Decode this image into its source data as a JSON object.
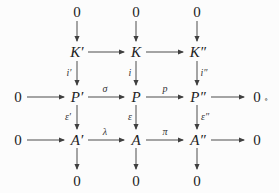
{
  "figure": {
    "type": "commutative-diagram",
    "nodes": {
      "zero_top_left": "0",
      "zero_top_mid": "0",
      "zero_top_right": "0",
      "K_prime": "K′",
      "K": "K",
      "K_dprime": "K″",
      "zero_mid_left": "0",
      "P_prime": "P′",
      "P": "P",
      "P_dprime": "P″",
      "zero_mid_right": "0",
      "zero_low_left": "0",
      "A_prime": "A′",
      "A": "A",
      "A_dprime": "A″",
      "zero_low_right": "0",
      "zero_bottom_left": "0",
      "zero_bottom_mid": "0",
      "zero_bottom_right": "0"
    },
    "terminal_mark": "∘",
    "edges": [
      {
        "from": "zero_top_left",
        "to": "K_prime",
        "label": ""
      },
      {
        "from": "zero_top_mid",
        "to": "K",
        "label": ""
      },
      {
        "from": "zero_top_right",
        "to": "K_dprime",
        "label": ""
      },
      {
        "from": "K_prime",
        "to": "K",
        "label": ""
      },
      {
        "from": "K",
        "to": "K_dprime",
        "label": ""
      },
      {
        "from": "K_prime",
        "to": "P_prime",
        "label": "i′"
      },
      {
        "from": "K",
        "to": "P",
        "label": "i"
      },
      {
        "from": "K_dprime",
        "to": "P_dprime",
        "label": "i″"
      },
      {
        "from": "zero_mid_left",
        "to": "P_prime",
        "label": ""
      },
      {
        "from": "P_prime",
        "to": "P",
        "label": "σ"
      },
      {
        "from": "P",
        "to": "P_dprime",
        "label": "p"
      },
      {
        "from": "P_dprime",
        "to": "zero_mid_right",
        "label": ""
      },
      {
        "from": "P_prime",
        "to": "A_prime",
        "label": "ε′"
      },
      {
        "from": "P",
        "to": "A",
        "label": "ε"
      },
      {
        "from": "P_dprime",
        "to": "A_dprime",
        "label": "ε″"
      },
      {
        "from": "zero_low_left",
        "to": "A_prime",
        "label": ""
      },
      {
        "from": "A_prime",
        "to": "A",
        "label": "λ"
      },
      {
        "from": "A",
        "to": "A_dprime",
        "label": "π"
      },
      {
        "from": "A_dprime",
        "to": "zero_low_right",
        "label": ""
      },
      {
        "from": "A_prime",
        "to": "zero_bottom_left",
        "label": ""
      },
      {
        "from": "A",
        "to": "zero_bottom_mid",
        "label": ""
      },
      {
        "from": "A_dprime",
        "to": "zero_bottom_right",
        "label": ""
      }
    ],
    "colors": {
      "background": "#fcfcfc",
      "ink": "#222222",
      "line": "#4d4d4d"
    }
  }
}
